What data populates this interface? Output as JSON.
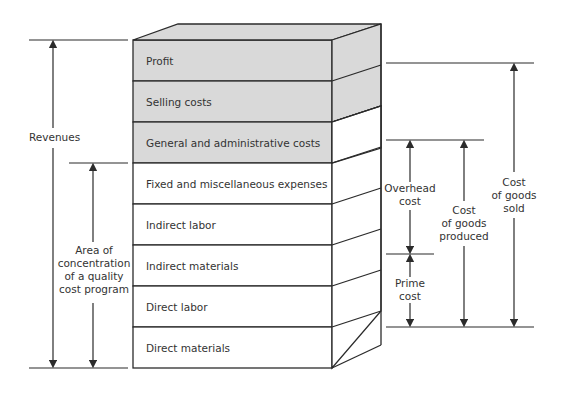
{
  "diagram": {
    "type": "stacked-3d-block",
    "colors": {
      "shaded": "#d9d9d9",
      "unshaded": "#ffffff",
      "line": "#2b2b2b"
    },
    "layers": [
      {
        "label": "Profit",
        "shaded": true
      },
      {
        "label": "Selling costs",
        "shaded": true
      },
      {
        "label": "General and administrative costs",
        "shaded": true
      },
      {
        "label": "Fixed and miscellaneous expenses",
        "shaded": false
      },
      {
        "label": "Indirect labor",
        "shaded": false
      },
      {
        "label": "Indirect materials",
        "shaded": false
      },
      {
        "label": "Direct labor",
        "shaded": false
      },
      {
        "label": "Direct materials",
        "shaded": false
      }
    ],
    "left_brackets": {
      "revenues": {
        "label": "Revenues",
        "spans": "Profit → Direct materials"
      },
      "quality_area": {
        "label_lines": [
          "Area of",
          "concentration",
          "of a quality",
          "cost program"
        ],
        "spans": "Fixed and miscellaneous expenses → Direct materials"
      }
    },
    "right_brackets": {
      "overhead": {
        "label_lines": [
          "Overhead",
          "cost"
        ],
        "spans": "Fixed and miscellaneous expenses → Indirect materials"
      },
      "prime": {
        "label_lines": [
          "Prime",
          "cost"
        ],
        "spans": "Direct labor → Direct materials"
      },
      "goods_produced": {
        "label_lines": [
          "Cost",
          "of goods",
          "produced"
        ],
        "spans": "Fixed and miscellaneous expenses → Direct materials"
      },
      "goods_sold": {
        "label_lines": [
          "Cost",
          "of goods",
          "sold"
        ],
        "spans": "Selling costs → Direct materials"
      }
    }
  }
}
